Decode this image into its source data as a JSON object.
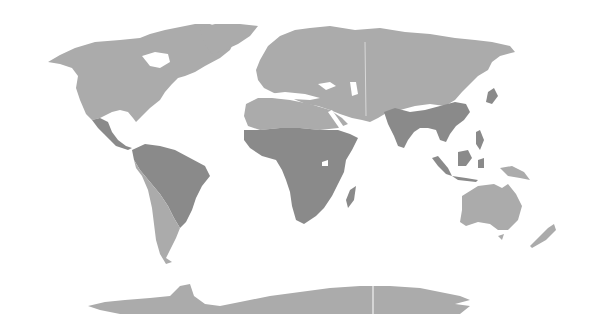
{
  "map": {
    "type": "world-choropleth",
    "projection": "equirectangular-like",
    "background_color": "#ffffff",
    "colors": {
      "light_region": "#ababab",
      "dark_region": "#8a8a8a"
    },
    "regions": [
      {
        "name": "North America",
        "shade": "light"
      },
      {
        "name": "Greenland",
        "shade": "light"
      },
      {
        "name": "Mexico and Central America",
        "shade": "dark"
      },
      {
        "name": "Northern South America (Amazon basin, Brazil)",
        "shade": "dark"
      },
      {
        "name": "Southern South America (Andes, Argentina, Chile)",
        "shade": "light"
      },
      {
        "name": "Europe",
        "shade": "light"
      },
      {
        "name": "North Africa / Sahara",
        "shade": "light"
      },
      {
        "name": "Sub-Saharan Africa",
        "shade": "dark"
      },
      {
        "name": "Madagascar",
        "shade": "dark"
      },
      {
        "name": "Middle East",
        "shade": "light"
      },
      {
        "name": "Russia / Central Asia",
        "shade": "light"
      },
      {
        "name": "South Asia (India)",
        "shade": "dark"
      },
      {
        "name": "Southern China / Southeast Asia",
        "shade": "dark"
      },
      {
        "name": "Japan",
        "shade": "dark"
      },
      {
        "name": "Maritime Southeast Asia (Indonesia, Borneo, Philippines)",
        "shade": "dark"
      },
      {
        "name": "Papua New Guinea",
        "shade": "light"
      },
      {
        "name": "Australia",
        "shade": "light"
      },
      {
        "name": "New Zealand",
        "shade": "light"
      },
      {
        "name": "Antarctica",
        "shade": "light"
      }
    ]
  }
}
